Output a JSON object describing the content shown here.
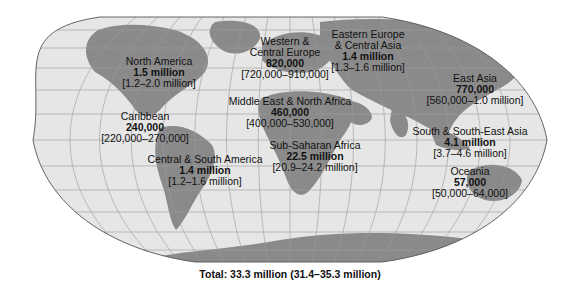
{
  "map": {
    "type": "choropleth-annotated",
    "projection": "flat-polar world map",
    "colors": {
      "ocean": "#e6e6e6",
      "land": "#8a8a8a",
      "graticule": "#9a9a9a",
      "border": "#555555",
      "text": "#111111"
    }
  },
  "regions": [
    {
      "id": "north-america",
      "name": "North America",
      "value": "1.5 million",
      "range": "[1.2–2.0 million]"
    },
    {
      "id": "caribbean",
      "name": "Caribbean",
      "value": "240,000",
      "range": "[220,000–270,000]"
    },
    {
      "id": "central-south-america",
      "name": "Central & South America",
      "value": "1.4 million",
      "range": "[1.2–1.6 million]"
    },
    {
      "id": "western-central-europe",
      "name_line1": "Western &",
      "name_line2": "Central Europe",
      "value": "820,000",
      "range": "[720,000–910,000]"
    },
    {
      "id": "eastern-europe-central-asia",
      "name_line1": "Eastern Europe",
      "name_line2": "& Central Asia",
      "value": "1.4 million",
      "range": "[1.3–1.6 million]"
    },
    {
      "id": "middle-east-north-africa",
      "name": "Middle East & North Africa",
      "value": "460,000",
      "range": "[400,000–530,000]"
    },
    {
      "id": "sub-saharan-africa",
      "name": "Sub-Saharan Africa",
      "value": "22.5 million",
      "range": "[20.9–24.2 million]"
    },
    {
      "id": "east-asia",
      "name": "East Asia",
      "value": "770,000",
      "range": "[560,000–1.0 million]"
    },
    {
      "id": "south-south-east-asia",
      "name": "South & South-East Asia",
      "value": "4.1 million",
      "range": "[3.7–4.6 million]"
    },
    {
      "id": "oceania",
      "name": "Oceania",
      "value": "57,000",
      "range": "[50,000–64,000]"
    }
  ],
  "total": "Total: 33.3 million (31.4–35.3 million)"
}
